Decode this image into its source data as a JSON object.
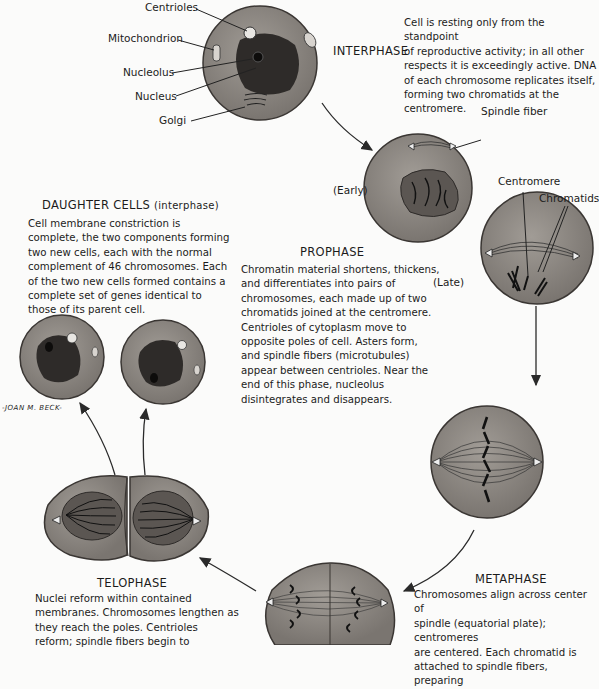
{
  "interphase": {
    "title": "INTERPHASE",
    "labels": {
      "centrioles": "Centrioles",
      "mitochondrion": "Mitochondrion",
      "nucleolus": "Nucleolus",
      "nucleus": "Nucleus",
      "golgi": "Golgi"
    },
    "description": [
      "Cell is resting only from the standpoint",
      "of reproductive activity; in all other",
      "respects it is exceedingly active. DNA",
      "of each chromosome replicates itself,",
      "forming two chromatids at the",
      "centromere."
    ]
  },
  "prophase": {
    "title": "PROPHASE",
    "early_label": "(Early)",
    "late_label": "(Late)",
    "labels": {
      "spindle_fiber": "Spindle fiber",
      "centromere": "Centromere",
      "chromatids": "Chromatids"
    },
    "description": [
      "Chromatin material shortens, thickens,",
      "and differentiates into pairs of",
      "chromosomes, each made up of two",
      "chromatids joined at the centromere.",
      "Centrioles of cytoplasm move to",
      "opposite poles of cell. Asters form,",
      "and spindle fibers (microtubules)",
      "appear between centrioles. Near the",
      "end of this phase, nucleolus",
      "disintegrates and disappears."
    ]
  },
  "daughter_cells": {
    "title": "DAUGHTER CELLS",
    "subtitle": "(interphase)",
    "description": [
      "Cell membrane constriction is",
      "complete, the two components forming",
      "two new cells, each with the normal",
      "complement of 46 chromosomes. Each",
      "of the two new cells formed contains a",
      "complete set of genes identical to",
      "those of its parent cell."
    ],
    "signature": "-JOAN M. BECK-"
  },
  "metaphase": {
    "title": "METAPHASE",
    "description": [
      "Chromosomes align across center of",
      "spindle (equatorial plate); centromeres",
      "are centered. Each chromatid is",
      "attached to spindle fibers, preparing"
    ]
  },
  "telophase": {
    "title": "TELOPHASE",
    "description": [
      "Nuclei reform within contained",
      "membranes. Chromosomes lengthen as",
      "they reach the poles. Centrioles",
      "reform; spindle fibers begin to"
    ]
  },
  "colors": {
    "cytoplasm": "#8a8580",
    "nucleus": "#2e2b29",
    "outline": "#3a3633",
    "text": "#1b1b1b",
    "background": "#fbfbfa"
  }
}
